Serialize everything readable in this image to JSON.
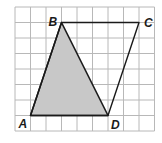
{
  "diagram": {
    "grid": {
      "cols": 9,
      "rows": 8,
      "origin_x": 15,
      "origin_y": 7,
      "cell": 15.5,
      "line_color": "#b8b8b8"
    },
    "shaded_region_color": "#c8c8c8",
    "outline_color": "#1a1a1a",
    "points": {
      "A": {
        "label": "A",
        "col": 1,
        "row": 7
      },
      "B": {
        "label": "B",
        "col": 3,
        "row": 1
      },
      "C": {
        "label": "C",
        "col": 8,
        "row": 1
      },
      "D": {
        "label": "D",
        "col": 6,
        "row": 7
      }
    },
    "shaded_triangle": [
      "A",
      "B",
      "D"
    ],
    "quadrilateral": [
      "A",
      "B",
      "C",
      "D"
    ]
  }
}
